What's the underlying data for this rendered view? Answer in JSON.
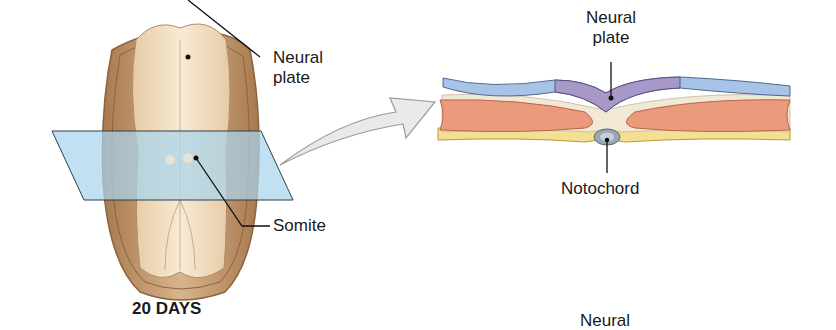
{
  "left_panel": {
    "stage_label": "20 DAYS",
    "labels": {
      "neural_plate_line1": "Neural",
      "neural_plate_line2": "plate",
      "somite": "Somite"
    }
  },
  "right_panel": {
    "labels": {
      "neural_plate_line1": "Neural",
      "neural_plate_line2": "plate",
      "notochord": "Notochord",
      "cut_off_bottom": "Neural"
    }
  },
  "colors": {
    "embryo_outer": "#c9a27c",
    "embryo_inner": "#f1dfc2",
    "section_plane": "#a9d4ec",
    "ectoderm": "#a7c3e6",
    "neural_plate": "#a898c8",
    "mesoderm": "#ec9a7c",
    "endoderm": "#f3e092",
    "notochord": "#9aa6b4",
    "arrow_fill": "#e9e9e9"
  }
}
